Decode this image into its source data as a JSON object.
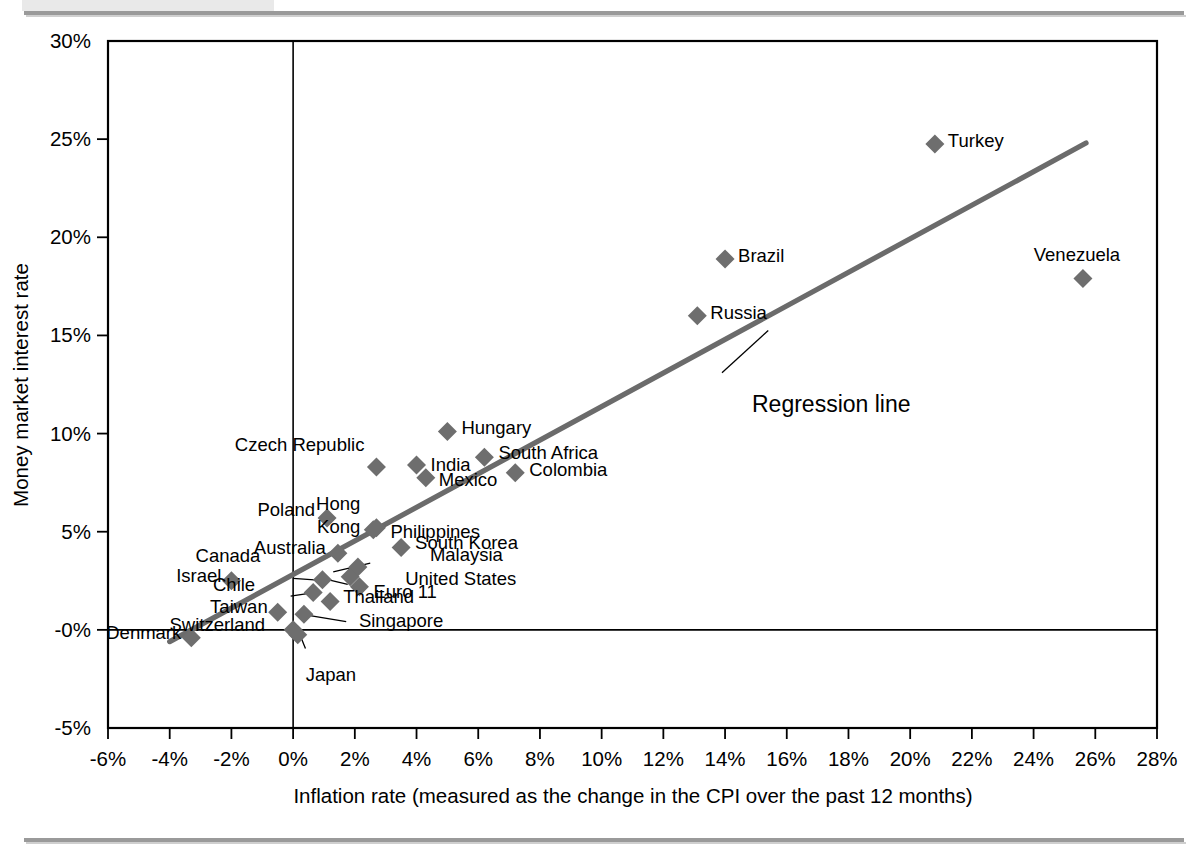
{
  "chart_data": {
    "type": "scatter",
    "title": "",
    "xlabel": "Inflation rate (measured as the change in the CPI over the past 12 months)",
    "ylabel": "Money market interest rate",
    "xlim": [
      -6,
      28
    ],
    "ylim": [
      -5,
      30
    ],
    "xtick_step": 2,
    "ytick_step": 5,
    "grid": false,
    "legend": "none",
    "xticks": [
      "-6%",
      "-4%",
      "-2%",
      "0%",
      "2%",
      "4%",
      "6%",
      "8%",
      "10%",
      "12%",
      "14%",
      "16%",
      "18%",
      "20%",
      "22%",
      "24%",
      "26%",
      "28%"
    ],
    "xtick_values": [
      -6,
      -4,
      -2,
      0,
      2,
      4,
      6,
      8,
      10,
      12,
      14,
      16,
      18,
      20,
      22,
      24,
      26,
      28
    ],
    "yticks": [
      "30%",
      "25%",
      "20%",
      "15%",
      "10%",
      "5%",
      "-0%",
      "-5%"
    ],
    "ytick_values": [
      30,
      25,
      20,
      15,
      10,
      5,
      0,
      -5
    ],
    "marker_color": "#6e6e6e",
    "marker_shape": "diamond",
    "regression": {
      "label": "Regression line",
      "x_start": -4.0,
      "y_start": -0.6,
      "x_end": 25.7,
      "y_end": 24.8,
      "line_color": "#6b6b6b"
    },
    "points": [
      {
        "name": "Denmark",
        "x": -3.3,
        "y": -0.4,
        "label_dx": -10,
        "label_dy": 1,
        "anchor": "end"
      },
      {
        "name": "Israel",
        "x": -2.0,
        "y": 2.5,
        "label_dx": -10,
        "label_dy": 1,
        "anchor": "end"
      },
      {
        "name": "Taiwan",
        "x": -0.5,
        "y": 0.9,
        "label_dx": -10,
        "label_dy": 1,
        "anchor": "end"
      },
      {
        "name": "Switzerland",
        "x": 0.0,
        "y": 0.0,
        "label_dx": -28,
        "label_dy": 1,
        "anchor": "end"
      },
      {
        "name": "Japan",
        "x": 0.15,
        "y": -0.25,
        "label_dx": 8,
        "label_dy": 46,
        "anchor": "start"
      },
      {
        "name": "Singapore",
        "x": 0.35,
        "y": 0.8,
        "label_dx": 55,
        "label_dy": 13,
        "anchor": "start"
      },
      {
        "name": "Chile",
        "x": 0.65,
        "y": 1.9,
        "label_dx": -58,
        "label_dy": -2,
        "anchor": "end"
      },
      {
        "name": "Canada",
        "x": 0.95,
        "y": 2.55,
        "label_dx": -62,
        "label_dy": -18,
        "anchor": "end"
      },
      {
        "name": "Thailand",
        "x": 1.2,
        "y": 1.45,
        "label_dx": 13,
        "label_dy": 2,
        "anchor": "start"
      },
      {
        "name": "Poland",
        "x": 1.1,
        "y": 5.7,
        "label_dx": -12,
        "label_dy": -2,
        "anchor": "end"
      },
      {
        "name": "Australia",
        "x": 1.45,
        "y": 3.9,
        "label_dx": -12,
        "label_dy": 1,
        "anchor": "end"
      },
      {
        "name": "United States",
        "x": 1.85,
        "y": 2.7,
        "label_dx": 55,
        "label_dy": 8,
        "anchor": "start"
      },
      {
        "name": "Euro 11",
        "x": 2.15,
        "y": 2.2,
        "label_dx": 14,
        "label_dy": 11,
        "anchor": "start"
      },
      {
        "name": "Malaysia",
        "x": 2.1,
        "y": 3.2,
        "label_dx": 72,
        "label_dy": -6,
        "anchor": "start"
      },
      {
        "name": "Hong Kong",
        "x": 2.6,
        "y": 5.1,
        "label_dx": -13,
        "label_dy": -20,
        "anchor": "end"
      },
      {
        "name": "Philippines",
        "x": 2.7,
        "y": 5.2,
        "label_dx": 14,
        "label_dy": 10,
        "anchor": "start"
      },
      {
        "name": "Czech Republic",
        "x": 2.7,
        "y": 8.3,
        "label_dx": -12,
        "label_dy": -16,
        "anchor": "end"
      },
      {
        "name": "South Korea",
        "x": 3.5,
        "y": 4.2,
        "label_dx": 14,
        "label_dy": 2,
        "anchor": "start"
      },
      {
        "name": "India",
        "x": 4.0,
        "y": 8.4,
        "label_dx": 14,
        "label_dy": 6,
        "anchor": "start"
      },
      {
        "name": "Mexico",
        "x": 4.3,
        "y": 7.75,
        "label_dx": 13,
        "label_dy": 8,
        "anchor": "start"
      },
      {
        "name": "Hungary",
        "x": 5.0,
        "y": 10.1,
        "label_dx": 14,
        "label_dy": 2,
        "anchor": "start"
      },
      {
        "name": "South Africa",
        "x": 6.2,
        "y": 8.8,
        "label_dx": 14,
        "label_dy": 2,
        "anchor": "start"
      },
      {
        "name": "Colombia",
        "x": 7.2,
        "y": 8.0,
        "label_dx": 14,
        "label_dy": 3,
        "anchor": "start"
      },
      {
        "name": "Russia",
        "x": 13.1,
        "y": 16.0,
        "label_dx": 13,
        "label_dy": 3,
        "anchor": "start"
      },
      {
        "name": "Brazil",
        "x": 14.0,
        "y": 18.9,
        "label_dx": 13,
        "label_dy": 3,
        "anchor": "start"
      },
      {
        "name": "Turkey",
        "x": 20.8,
        "y": 24.75,
        "label_dx": 13,
        "label_dy": 3,
        "anchor": "start"
      },
      {
        "name": "Venezuela",
        "x": 25.6,
        "y": 17.9,
        "label_dx": -6,
        "label_dy": -18,
        "anchor": "middle"
      }
    ],
    "leaders": [
      {
        "name": "japan-leader",
        "x1": 0.4,
        "y1": -0.95,
        "x2": 0.22,
        "y2": -0.25
      },
      {
        "name": "singapore-leader",
        "x1": 1.72,
        "y1": 0.42,
        "x2": 0.45,
        "y2": 0.75
      },
      {
        "name": "chile-leader",
        "x1": -0.08,
        "y1": 1.72,
        "x2": 0.62,
        "y2": 1.88
      },
      {
        "name": "canada-leader",
        "x1": 0.0,
        "y1": 2.62,
        "x2": 0.92,
        "y2": 2.52
      },
      {
        "name": "unitedstates-leader",
        "x1": 1.77,
        "y1": 2.32,
        "x2": 0.95,
        "y2": 2.62
      },
      {
        "name": "malaysia-leader",
        "x1": 2.5,
        "y1": 3.4,
        "x2": 1.3,
        "y2": 2.95
      },
      {
        "name": "regression-leader",
        "x1": 13.9,
        "y1": 13.1,
        "x2": 15.4,
        "y2": 15.25
      }
    ]
  },
  "annotations": {
    "regression_label": "Regression line"
  }
}
